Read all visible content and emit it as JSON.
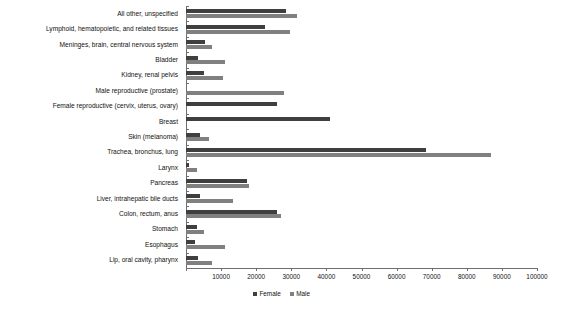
{
  "chart_data": {
    "type": "bar",
    "orientation": "horizontal",
    "title": "",
    "xlabel": "",
    "ylabel": "",
    "xlim": [
      0,
      100000
    ],
    "xticks": [
      0,
      10000,
      20000,
      30000,
      40000,
      50000,
      60000,
      70000,
      80000,
      90000,
      100000
    ],
    "xtick_labels": [
      "",
      "10000",
      "20000",
      "30000",
      "40000",
      "50000",
      "60000",
      "70000",
      "80000",
      "90000",
      "100000"
    ],
    "grid": false,
    "legend_position": "bottom",
    "categories": [
      "All other, unspecified",
      "Lymphoid, hematopoietic, and related tissues",
      "Meninges, brain, central nervous system",
      "Bladder",
      "Kidney, renal pelvis",
      "Male reproductive (prostate)",
      "Female reproductive (cervix, uterus, ovary)",
      "Breast",
      "Skin (melanoma)",
      "Trachea, bronchus, lung",
      "Larynx",
      "Pancreas",
      "Liver, intrahepatic bile ducts",
      "Colon, rectum, anus",
      "Stomach",
      "Esophagus",
      "Lip, oral cavity, pharynx"
    ],
    "series": [
      {
        "name": "Female",
        "color": "#3f3f3f",
        "values": [
          28500,
          22500,
          5500,
          3500,
          5000,
          0,
          26000,
          41000,
          4000,
          68500,
          800,
          17500,
          4000,
          26000,
          3000,
          2500,
          3500
        ]
      },
      {
        "name": "Male",
        "color": "#808080",
        "values": [
          31500,
          29500,
          7500,
          11000,
          10500,
          28000,
          0,
          0,
          6500,
          87000,
          3200,
          18000,
          13500,
          27000,
          5000,
          11000,
          7500
        ]
      }
    ],
    "legend": [
      "Female",
      "Male"
    ]
  },
  "legend": {
    "female_label": "Female",
    "male_label": "Male"
  }
}
